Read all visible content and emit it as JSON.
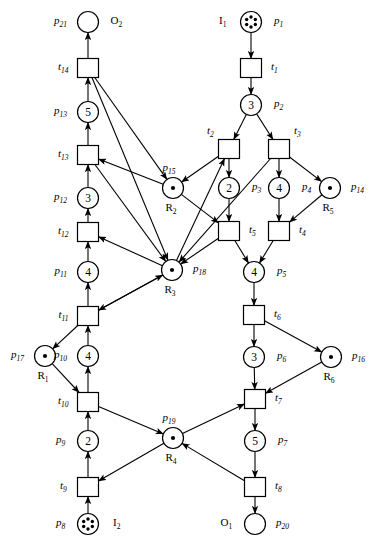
{
  "diagram": {
    "type": "petri-net",
    "title": "",
    "width": 375,
    "height": 546,
    "colors": {
      "stroke": "#000000",
      "fill": "#ffffff",
      "background": "#ffffff"
    },
    "places": [
      {
        "id": "p21",
        "label": "p21",
        "sub": "21",
        "x": 88,
        "y": 22,
        "tokens": 0,
        "capacity": "",
        "label_side": "left",
        "extra": "O2",
        "extra_sub": "2",
        "extra_side": "right"
      },
      {
        "id": "p13",
        "label": "p13",
        "sub": "13",
        "x": 88,
        "y": 112,
        "tokens": 0,
        "capacity": "5",
        "label_side": "left"
      },
      {
        "id": "p12",
        "label": "p12",
        "sub": "12",
        "x": 88,
        "y": 198,
        "tokens": 0,
        "capacity": "3",
        "label_side": "left"
      },
      {
        "id": "p11",
        "label": "p11",
        "sub": "11",
        "x": 88,
        "y": 272,
        "tokens": 0,
        "capacity": "4",
        "label_side": "left"
      },
      {
        "id": "p10",
        "label": "p10",
        "sub": "10",
        "x": 88,
        "y": 356,
        "tokens": 0,
        "capacity": "4",
        "label_side": "left"
      },
      {
        "id": "p9",
        "label": "p9",
        "sub": "9",
        "x": 88,
        "y": 441,
        "tokens": 0,
        "capacity": "2",
        "label_side": "left"
      },
      {
        "id": "p8",
        "label": "p8",
        "sub": "8",
        "x": 88,
        "y": 524,
        "tokens": 6,
        "capacity": "",
        "label_side": "left",
        "extra": "I2",
        "extra_sub": "2",
        "extra_side": "right"
      },
      {
        "id": "p1",
        "label": "p1",
        "sub": "1",
        "x": 251,
        "y": 22,
        "tokens": 6,
        "capacity": "",
        "label_side": "right",
        "extra": "I1",
        "extra_sub": "1",
        "extra_side": "left"
      },
      {
        "id": "p2",
        "label": "p2",
        "sub": "2",
        "x": 251,
        "y": 105,
        "tokens": 0,
        "capacity": "3",
        "label_side": "right"
      },
      {
        "id": "p3",
        "label": "p3",
        "sub": "3",
        "x": 229,
        "y": 188,
        "tokens": 0,
        "capacity": "2",
        "label_side": "right"
      },
      {
        "id": "p4",
        "label": "p4",
        "sub": "4",
        "x": 279,
        "y": 188,
        "tokens": 0,
        "capacity": "4",
        "label_side": "right"
      },
      {
        "id": "p5",
        "label": "p5",
        "sub": "5",
        "x": 254,
        "y": 272,
        "tokens": 0,
        "capacity": "4",
        "label_side": "right"
      },
      {
        "id": "p6",
        "label": "p6",
        "sub": "6",
        "x": 254,
        "y": 357,
        "tokens": 0,
        "capacity": "3",
        "label_side": "right"
      },
      {
        "id": "p7",
        "label": "p7",
        "sub": "7",
        "x": 255,
        "y": 441,
        "tokens": 0,
        "capacity": "5",
        "label_side": "right"
      },
      {
        "id": "p20",
        "label": "p20",
        "sub": "20",
        "x": 255,
        "y": 524,
        "tokens": 0,
        "capacity": "",
        "label_side": "right",
        "extra": "O1",
        "extra_sub": "1",
        "extra_side": "left"
      },
      {
        "id": "p15",
        "label": "p15",
        "sub": "15",
        "x": 173,
        "y": 188,
        "tokens": 1,
        "capacity": "",
        "label_side": "top",
        "resource": "R2",
        "resource_sub": "2"
      },
      {
        "id": "p18",
        "label": "p18",
        "sub": "18",
        "x": 172,
        "y": 270,
        "tokens": 1,
        "capacity": "",
        "label_side": "right",
        "resource": "R3",
        "resource_sub": "3"
      },
      {
        "id": "p14",
        "label": "p14",
        "sub": "14",
        "x": 330,
        "y": 188,
        "tokens": 1,
        "capacity": "",
        "label_side": "right",
        "resource": "R5",
        "resource_sub": "5"
      },
      {
        "id": "p16",
        "label": "p16",
        "sub": "16",
        "x": 331,
        "y": 357,
        "tokens": 1,
        "capacity": "",
        "label_side": "right",
        "resource": "R6",
        "resource_sub": "6"
      },
      {
        "id": "p17",
        "label": "p17",
        "sub": "17",
        "x": 45,
        "y": 356,
        "tokens": 1,
        "capacity": "",
        "label_side": "left",
        "resource": "R1",
        "resource_sub": "1"
      },
      {
        "id": "p19",
        "label": "p19",
        "sub": "19",
        "x": 173,
        "y": 438,
        "tokens": 1,
        "capacity": "",
        "label_side": "top",
        "resource": "R4",
        "resource_sub": "4"
      }
    ],
    "transitions": [
      {
        "id": "t14",
        "label": "t14",
        "sub": "14",
        "x": 88,
        "y": 68,
        "label_side": "left"
      },
      {
        "id": "t13",
        "label": "t13",
        "sub": "13",
        "x": 88,
        "y": 155,
        "label_side": "left"
      },
      {
        "id": "t12",
        "label": "t12",
        "sub": "12",
        "x": 88,
        "y": 232,
        "label_side": "left"
      },
      {
        "id": "t11",
        "label": "t11",
        "sub": "11",
        "x": 88,
        "y": 316,
        "label_side": "left"
      },
      {
        "id": "t10",
        "label": "t10",
        "sub": "10",
        "x": 88,
        "y": 402,
        "label_side": "left"
      },
      {
        "id": "t9",
        "label": "t9",
        "sub": "9",
        "x": 88,
        "y": 487,
        "label_side": "left"
      },
      {
        "id": "t1",
        "label": "t1",
        "sub": "1",
        "x": 251,
        "y": 68,
        "label_side": "right"
      },
      {
        "id": "t2",
        "label": "t2",
        "sub": "2",
        "x": 229,
        "y": 149,
        "label_side": "topleft"
      },
      {
        "id": "t3",
        "label": "t3",
        "sub": "3",
        "x": 279,
        "y": 149,
        "label_side": "topright"
      },
      {
        "id": "t5",
        "label": "t5",
        "sub": "5",
        "x": 229,
        "y": 231,
        "label_side": "right"
      },
      {
        "id": "t4",
        "label": "t4",
        "sub": "4",
        "x": 279,
        "y": 231,
        "label_side": "right"
      },
      {
        "id": "t6",
        "label": "t6",
        "sub": "6",
        "x": 254,
        "y": 315,
        "label_side": "right"
      },
      {
        "id": "t7",
        "label": "t7",
        "sub": "7",
        "x": 255,
        "y": 399,
        "label_side": "right"
      },
      {
        "id": "t8",
        "label": "t8",
        "sub": "8",
        "x": 255,
        "y": 487,
        "label_side": "right"
      }
    ],
    "arcs": [
      {
        "from": "t14",
        "to": "p21"
      },
      {
        "from": "p13",
        "to": "t14"
      },
      {
        "from": "t13",
        "to": "p13"
      },
      {
        "from": "p12",
        "to": "t13"
      },
      {
        "from": "t12",
        "to": "p12"
      },
      {
        "from": "p11",
        "to": "t12"
      },
      {
        "from": "t11",
        "to": "p11"
      },
      {
        "from": "p10",
        "to": "t11"
      },
      {
        "from": "t10",
        "to": "p10"
      },
      {
        "from": "p9",
        "to": "t10"
      },
      {
        "from": "t9",
        "to": "p9"
      },
      {
        "from": "p8",
        "to": "t9"
      },
      {
        "from": "p1",
        "to": "t1"
      },
      {
        "from": "t1",
        "to": "p2"
      },
      {
        "from": "p2",
        "to": "t2"
      },
      {
        "from": "p2",
        "to": "t3"
      },
      {
        "from": "t2",
        "to": "p3"
      },
      {
        "from": "t3",
        "to": "p4"
      },
      {
        "from": "p3",
        "to": "t5"
      },
      {
        "from": "p4",
        "to": "t4"
      },
      {
        "from": "t5",
        "to": "p5"
      },
      {
        "from": "t4",
        "to": "p5"
      },
      {
        "from": "p5",
        "to": "t6"
      },
      {
        "from": "t6",
        "to": "p6"
      },
      {
        "from": "p6",
        "to": "t7"
      },
      {
        "from": "t7",
        "to": "p7"
      },
      {
        "from": "p7",
        "to": "t8"
      },
      {
        "from": "t8",
        "to": "p20"
      },
      {
        "from": "p15",
        "to": "t13"
      },
      {
        "from": "p15",
        "to": "t5"
      },
      {
        "from": "t14",
        "to": "p15"
      },
      {
        "from": "t2",
        "to": "p15"
      },
      {
        "from": "p18",
        "to": "t12"
      },
      {
        "from": "p18",
        "to": "t2"
      },
      {
        "from": "t13",
        "to": "p18"
      },
      {
        "from": "t14",
        "to": "p18"
      },
      {
        "from": "t5",
        "to": "p18"
      },
      {
        "from": "t11",
        "to": "p18"
      },
      {
        "from": "t3",
        "to": "p18"
      },
      {
        "from": "p18",
        "to": "t11"
      },
      {
        "from": "p14",
        "to": "t4"
      },
      {
        "from": "t3",
        "to": "p14"
      },
      {
        "from": "p16",
        "to": "t7"
      },
      {
        "from": "t6",
        "to": "p16"
      },
      {
        "from": "p17",
        "to": "t10"
      },
      {
        "from": "t11",
        "to": "p17"
      },
      {
        "from": "p19",
        "to": "t9"
      },
      {
        "from": "p19",
        "to": "t7"
      },
      {
        "from": "t10",
        "to": "p19"
      },
      {
        "from": "t8",
        "to": "p19"
      }
    ]
  }
}
